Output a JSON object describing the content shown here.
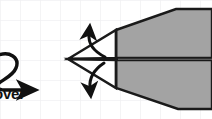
{
  "figure": {
    "kind": "origami-fold-diagram",
    "background": {
      "style": "graph-paper",
      "page_color": "#ffffff",
      "grid_color": "#f2f2f4",
      "grid_spacing_px": 20
    },
    "canvas": {
      "width": 212,
      "height": 119
    }
  },
  "colors": {
    "paper_fill": "#a3a3a3",
    "paper_fill_light": "#ffffff",
    "outline": "#1a1a1a",
    "crease_line": "#5a5a5a",
    "arrow": "#111111",
    "text": "#111111"
  },
  "annotations": {
    "turn_over": {
      "label": "over",
      "full_phrase": "turn over",
      "icon": "turn-over-loop-arrow",
      "truncated": true,
      "position": "left-edge"
    },
    "fold_up": {
      "icon": "curved-fold-arrow-up",
      "direction": "up",
      "label": ""
    },
    "fold_down": {
      "icon": "curved-fold-arrow-down",
      "direction": "down",
      "label": ""
    }
  },
  "geometry": {
    "apex": {
      "x": 68,
      "y": 59
    },
    "wing_break_x": 116,
    "top_bend": {
      "x": 176,
      "y": 9
    },
    "bottom_bend": {
      "x": 178,
      "y": 109
    },
    "centerline_y": 59
  }
}
